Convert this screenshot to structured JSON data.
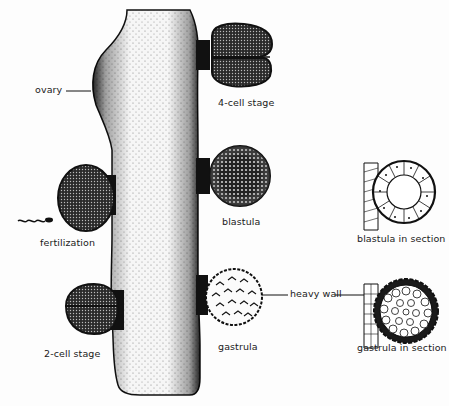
{
  "diagram": {
    "labels": {
      "ovary": "ovary",
      "four_cell": "4-cell stage",
      "blastula": "blastula",
      "fertilization": "fertilization",
      "two_cell": "2-cell stage",
      "gastrula": "gastrula",
      "heavy_wall": "heavy wall",
      "blastula_section": "blastula in section",
      "gastrula_section": "gastrula in section"
    },
    "colors": {
      "ink": "#111111",
      "background": "#fdfdfd"
    }
  }
}
